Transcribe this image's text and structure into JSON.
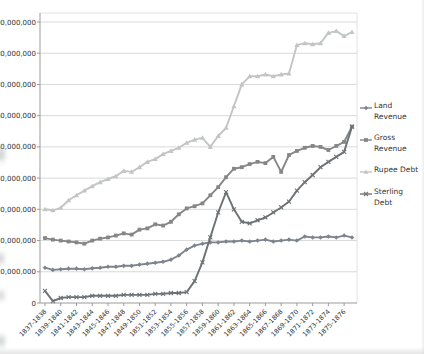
{
  "chart_data": {
    "type": "line",
    "title": "",
    "xlabel": "",
    "ylabel": "",
    "ylim": [
      0,
      90000000
    ],
    "y_tick_interval": 10000000,
    "y_tick_labels": [
      "0",
      "10,000,000",
      "20,000,000",
      "30,000,000",
      "40,000,000",
      "50,000,000",
      "60,000,000",
      "70,000,000",
      "80,000,000",
      "90,000,000"
    ],
    "grid": "horizontal",
    "legend_position": "right",
    "categories": [
      "1837-1838",
      "1838-1839",
      "1839-1840",
      "1840-1841",
      "1841-1842",
      "1842-1843",
      "1843-1844",
      "1844-1845",
      "1845-1846",
      "1846-1847",
      "1847-1848",
      "1848-1849",
      "1849-1850",
      "1850-1851",
      "1851-1852",
      "1852-1853",
      "1853-1854",
      "1854-1855",
      "1855-1856",
      "1856-1857",
      "1857-1858",
      "1858-1859",
      "1859-1860",
      "1860-1861",
      "1861-1862",
      "1862-1863",
      "1863-1864",
      "1864-1865",
      "1865-1866",
      "1866-1867",
      "1867-1868",
      "1868-1869",
      "1869-1870",
      "1870-1871",
      "1871-1872",
      "1872-1873",
      "1873-1874",
      "1874-1875",
      "1875-1876",
      "1876-1877"
    ],
    "x_tick_labels_shown": [
      "1837-1838",
      "1839-1840",
      "1841-1842",
      "1843-1844",
      "1845-1846",
      "1847-1848",
      "1849-1850",
      "1851-1852",
      "1853-1854",
      "1855-1856",
      "1857-1858",
      "1859-1860",
      "1861-1862",
      "1863-1864",
      "1865-1866",
      "1867-1868",
      "1869-1870",
      "1871-1872",
      "1873-1874",
      "1875-1876"
    ],
    "series": [
      {
        "name": "Land Revenue",
        "marker": "diamond",
        "color": "#7d848e",
        "values": [
          11300000,
          10600000,
          10800000,
          11000000,
          11000000,
          10800000,
          11100000,
          11300000,
          11600000,
          11600000,
          11900000,
          11900000,
          12300000,
          12600000,
          12900000,
          13200000,
          13900000,
          15200000,
          17100000,
          18400000,
          19000000,
          19400000,
          19400000,
          19700000,
          19700000,
          20000000,
          19700000,
          20000000,
          20300000,
          19700000,
          20000000,
          20300000,
          20000000,
          21300000,
          21000000,
          21000000,
          21300000,
          21000000,
          21600000,
          21000000
        ]
      },
      {
        "name": "Gross Revenue",
        "marker": "square",
        "color": "#868686",
        "values": [
          20800000,
          20300000,
          20000000,
          19700000,
          19400000,
          19000000,
          20000000,
          20600000,
          21000000,
          21600000,
          22300000,
          21900000,
          23500000,
          23900000,
          25200000,
          24800000,
          26000000,
          28400000,
          30300000,
          31000000,
          31900000,
          34500000,
          37100000,
          40300000,
          43000000,
          43500000,
          44500000,
          45200000,
          44800000,
          46800000,
          42000000,
          47400000,
          48700000,
          49700000,
          50300000,
          50000000,
          49000000,
          50300000,
          51600000,
          56500000
        ]
      },
      {
        "name": "Rupee Debt",
        "marker": "triangle",
        "color": "#c2c6c2",
        "values": [
          30000000,
          29700000,
          30500000,
          32900000,
          34500000,
          36000000,
          37400000,
          38700000,
          39700000,
          40600000,
          42300000,
          42000000,
          43500000,
          45200000,
          46100000,
          47700000,
          48700000,
          49700000,
          51300000,
          52300000,
          52900000,
          50000000,
          53500000,
          56100000,
          63000000,
          70000000,
          72600000,
          72600000,
          73200000,
          72600000,
          73200000,
          73500000,
          82600000,
          83200000,
          82900000,
          83200000,
          86500000,
          87100000,
          85500000,
          86800000
        ]
      },
      {
        "name": "Sterling Debt",
        "marker": "x",
        "color": "#6d7275",
        "values": [
          3900000,
          600000,
          1600000,
          1900000,
          1900000,
          1900000,
          2300000,
          2300000,
          2300000,
          2300000,
          2600000,
          2600000,
          2600000,
          2600000,
          2900000,
          2900000,
          3200000,
          3200000,
          3500000,
          7000000,
          13000000,
          21000000,
          29000000,
          35500000,
          30000000,
          26000000,
          25500000,
          26500000,
          27400000,
          29000000,
          30600000,
          32500000,
          36000000,
          38700000,
          41000000,
          43500000,
          45200000,
          46800000,
          48400000,
          56500000
        ]
      }
    ]
  }
}
